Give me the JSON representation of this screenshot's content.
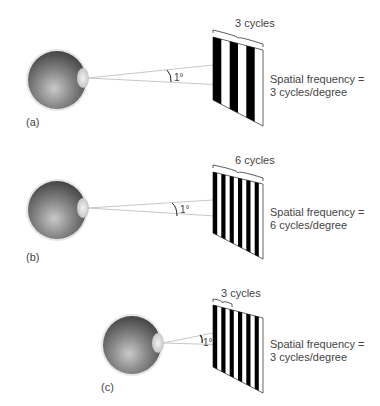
{
  "panels": [
    {
      "id": "a",
      "label": "(a)",
      "bracket_label": "3 cycles",
      "angle_label": "1°",
      "frequency_line1": "Spatial frequency =",
      "frequency_line2": "3 cycles/degree",
      "bars": 6
    },
    {
      "id": "b",
      "label": "(b)",
      "bracket_label": "6 cycles",
      "angle_label": "1°",
      "frequency_line1": "Spatial frequency =",
      "frequency_line2": "6 cycles/degree",
      "bars": 12
    },
    {
      "id": "c",
      "label": "(c)",
      "bracket_label": "3 cycles",
      "angle_label": "1°",
      "frequency_line1": "Spatial frequency =",
      "frequency_line2": "3 cycles/degree",
      "bars": 12
    }
  ],
  "colors": {
    "eye_dark": "#4a4a4a",
    "eye_light": "#b8b8b8",
    "grating_black": "#000000",
    "grating_white": "#ffffff",
    "sight_line": "#c8c8c8"
  }
}
